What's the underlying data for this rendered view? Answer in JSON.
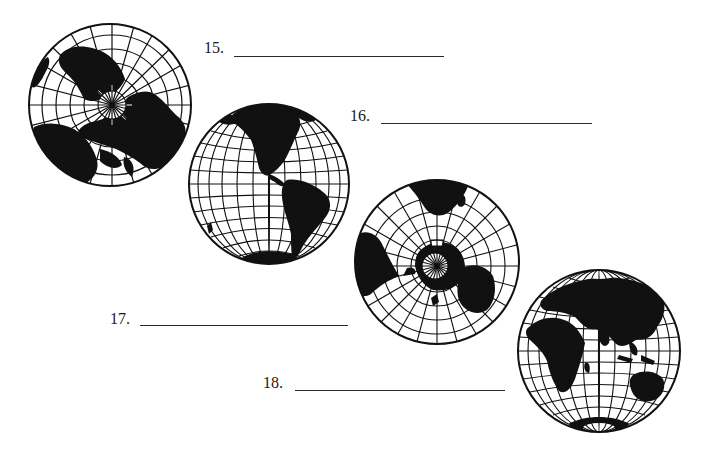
{
  "worksheet": {
    "questions": [
      {
        "number": "15.",
        "answer": "",
        "globe": "north-polar-view"
      },
      {
        "number": "16.",
        "answer": "",
        "globe": "western-hemisphere-view"
      },
      {
        "number": "17.",
        "answer": "",
        "globe": "south-polar-view"
      },
      {
        "number": "18.",
        "answer": "",
        "globe": "eastern-hemisphere-view"
      }
    ]
  },
  "colors": {
    "ink": "#111111",
    "paper": "#ffffff"
  }
}
